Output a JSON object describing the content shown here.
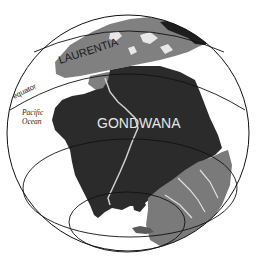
{
  "map": {
    "title": "Paleogeographic globe",
    "labels": {
      "laurentia": "LAURENTIA",
      "gondwana": "GONDWANA",
      "equator": "equator",
      "pacific_line1": "Pacific",
      "pacific_line2": "Ocean"
    },
    "colors": {
      "background": "#ffffff",
      "gondwana_land": "#2b2b2b",
      "laurentia_land": "#808080",
      "other_land": "#7a7a7a",
      "dark_land": "#1e1e1e",
      "ocean": "#ffffff",
      "grid_lines": "#111111",
      "label_light": "#e6e6e6",
      "label_dark": "#1a1a1a"
    }
  }
}
